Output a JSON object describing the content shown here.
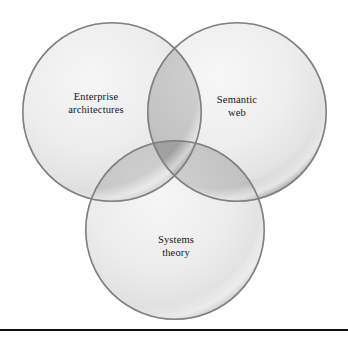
{
  "figure": {
    "type": "venn-diagram",
    "title": "",
    "background_color": "#ffffff",
    "sets_count": 3,
    "circles": [
      {
        "id": "enterprise-architectures",
        "label": "Enterprise architectures",
        "label_lines": [
          "Enterprise",
          "architectures"
        ],
        "position": "top-left",
        "center_x": 112,
        "center_y": 112,
        "radius": 90,
        "fill_color": "#ededed",
        "rim_color": "#8a8a8a"
      },
      {
        "id": "semantic-web",
        "label": "Semantic web",
        "label_lines": [
          "Semantic",
          "web"
        ],
        "position": "top-right",
        "center_x": 237,
        "center_y": 112,
        "radius": 90,
        "fill_color": "#ededed",
        "rim_color": "#8a8a8a"
      },
      {
        "id": "systems-theory",
        "label": "Systems theory",
        "label_lines": [
          "Systems",
          "theory"
        ],
        "position": "bottom-center",
        "center_x": 175,
        "center_y": 230,
        "radius": 90,
        "fill_color": "#ededed",
        "rim_color": "#8a8a8a"
      }
    ],
    "overlaps": {
      "pairwise_fill_color": "#bdbdbd",
      "triple_fill_color": "#9a9a9a"
    },
    "rule": {
      "visible": true,
      "color": "#111111",
      "thickness_px": 2
    }
  }
}
